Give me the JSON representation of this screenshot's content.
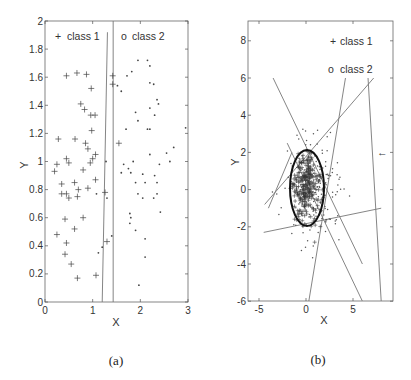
{
  "chart_data": [
    {
      "panel": "(a)",
      "type": "scatter",
      "xlabel": "X",
      "ylabel": "Y",
      "xlim": [
        0,
        3
      ],
      "ylim": [
        0,
        2
      ],
      "xticks": [
        "0",
        "1",
        "2",
        "3"
      ],
      "yticks": [
        "0",
        "0.2",
        "0.4",
        "0.6",
        "0.8",
        "1",
        "1.2",
        "1.4",
        "1.6",
        "1.8",
        "2"
      ],
      "legend": [
        {
          "marker": "+",
          "label": "class 1"
        },
        {
          "marker": "o",
          "label": "class 2"
        }
      ],
      "series": [
        {
          "name": "class 1",
          "marker": "+",
          "points": [
            [
              0.45,
              1.61
            ],
            [
              0.67,
              1.63
            ],
            [
              0.87,
              1.62
            ],
            [
              0.97,
              1.52
            ],
            [
              0.75,
              1.41
            ],
            [
              0.83,
              1.37
            ],
            [
              0.96,
              1.33
            ],
            [
              1.05,
              1.33
            ],
            [
              0.98,
              1.22
            ],
            [
              0.28,
              1.16
            ],
            [
              0.63,
              1.16
            ],
            [
              0.85,
              1.13
            ],
            [
              0.9,
              1.09
            ],
            [
              1.06,
              1.05
            ],
            [
              1.0,
              1.02
            ],
            [
              0.45,
              1.02
            ],
            [
              0.5,
              0.99
            ],
            [
              0.95,
              0.99
            ],
            [
              0.25,
              0.98
            ],
            [
              0.2,
              0.93
            ],
            [
              0.8,
              0.94
            ],
            [
              0.62,
              0.85
            ],
            [
              1.06,
              0.87
            ],
            [
              0.35,
              0.84
            ],
            [
              0.7,
              0.8
            ],
            [
              0.9,
              0.81
            ],
            [
              0.35,
              0.77
            ],
            [
              0.45,
              0.77
            ],
            [
              0.5,
              0.74
            ],
            [
              0.68,
              0.75
            ],
            [
              0.42,
              0.59
            ],
            [
              0.8,
              0.6
            ],
            [
              0.62,
              0.52
            ],
            [
              0.25,
              0.48
            ],
            [
              0.45,
              0.42
            ],
            [
              0.42,
              0.34
            ],
            [
              0.55,
              0.27
            ],
            [
              0.68,
              0.17
            ],
            [
              1.07,
              0.19
            ],
            [
              1.3,
              0.43
            ],
            [
              1.26,
              0.78
            ],
            [
              1.42,
              1.61
            ],
            [
              1.42,
              1.55
            ],
            [
              1.55,
              1.13
            ]
          ]
        },
        {
          "name": "class 2",
          "marker": ".",
          "points": [
            [
              1.95,
              1.72
            ],
            [
              2.15,
              1.72
            ],
            [
              2.2,
              1.68
            ],
            [
              1.72,
              1.61
            ],
            [
              1.82,
              1.64
            ],
            [
              1.6,
              1.5
            ],
            [
              1.52,
              1.54
            ],
            [
              2.2,
              1.56
            ],
            [
              2.28,
              1.55
            ],
            [
              1.9,
              1.35
            ],
            [
              2.2,
              1.38
            ],
            [
              2.35,
              1.44
            ],
            [
              2.38,
              1.41
            ],
            [
              2.3,
              1.33
            ],
            [
              1.95,
              1.29
            ],
            [
              1.7,
              1.23
            ],
            [
              2.15,
              1.23
            ],
            [
              2.2,
              1.23
            ],
            [
              2.95,
              1.24
            ],
            [
              1.85,
              1.0
            ],
            [
              1.6,
              0.92
            ],
            [
              1.75,
              0.95
            ],
            [
              1.8,
              0.92
            ],
            [
              2.2,
              1.05
            ],
            [
              2.4,
              0.98
            ],
            [
              2.55,
              1.06
            ],
            [
              2.62,
              1.0
            ],
            [
              2.7,
              1.1
            ],
            [
              1.65,
              0.98
            ],
            [
              1.9,
              0.85
            ],
            [
              2.05,
              0.91
            ],
            [
              2.3,
              0.9
            ],
            [
              2.35,
              0.85
            ],
            [
              2.1,
              0.85
            ],
            [
              1.95,
              0.77
            ],
            [
              2.05,
              0.74
            ],
            [
              2.28,
              0.74
            ],
            [
              2.35,
              0.77
            ],
            [
              2.42,
              0.64
            ],
            [
              1.78,
              0.63
            ],
            [
              1.8,
              0.6
            ],
            [
              1.9,
              0.51
            ],
            [
              1.78,
              0.56
            ],
            [
              2.1,
              0.45
            ],
            [
              2.1,
              0.32
            ],
            [
              1.97,
              0.12
            ],
            [
              1.08,
              0.77
            ],
            [
              1.2,
              0.39
            ],
            [
              1.12,
              0.35
            ],
            [
              1.3,
              0.74
            ],
            [
              1.4,
              0.47
            ],
            [
              1.28,
              1.0
            ]
          ]
        }
      ],
      "boundaries": [
        {
          "name": "vertical boundary",
          "points": [
            [
              1.43,
              0
            ],
            [
              1.43,
              2
            ]
          ]
        },
        {
          "name": "slanted boundary",
          "points": [
            [
              1.2,
              0
            ],
            [
              1.31,
              1.92
            ]
          ]
        }
      ]
    },
    {
      "panel": "(b)",
      "type": "scatter",
      "xlabel": "X",
      "ylabel": "Y",
      "xlim": [
        -6.2,
        9.2
      ],
      "ylim": [
        -6,
        9
      ],
      "xticks": [
        "-5",
        "0",
        "5"
      ],
      "yticks": [
        "-6",
        "-4",
        "-2",
        "0",
        "2",
        "4",
        "6",
        "8"
      ],
      "legend": [
        {
          "marker": "+",
          "label": "class 1"
        },
        {
          "marker": "o",
          "label": "class 2"
        }
      ],
      "annotations": [
        {
          "type": "ellipse-boundary",
          "center": [
            0.0,
            0.1
          ],
          "rx": 1.8,
          "ry": 2.1
        },
        {
          "type": "arrow-marker",
          "glyph": "←",
          "at": [
            8.1,
            2.0
          ]
        }
      ],
      "boundaries": [
        {
          "points": [
            [
              -3.5,
              6
            ],
            [
              6,
              -4
            ]
          ]
        },
        {
          "points": [
            [
              -4.4,
              -0.8
            ],
            [
              7.2,
              6
            ]
          ]
        },
        {
          "points": [
            [
              4.2,
              6
            ],
            [
              0.3,
              -6
            ]
          ]
        },
        {
          "points": [
            [
              6.6,
              6
            ],
            [
              8.0,
              -6
            ]
          ]
        },
        {
          "points": [
            [
              -4.5,
              -2.3
            ],
            [
              8.0,
              -1.0
            ]
          ]
        },
        {
          "points": [
            [
              -2.0,
              2.5
            ],
            [
              6,
              -6
            ]
          ]
        },
        {
          "points": [
            [
              -4.0,
              -1.0
            ],
            [
              -1.5,
              2.0
            ]
          ]
        }
      ],
      "series": [
        {
          "name": "class 1",
          "marker": "+",
          "note": "dense cluster centered near (0,0)"
        },
        {
          "name": "class 2",
          "marker": ".",
          "note": "diffuse cloud spread around the class 1 cluster"
        }
      ]
    }
  ],
  "captions": {
    "a": "(a)",
    "b": "(b)"
  },
  "axes": {
    "a": {
      "xlabel": "X",
      "ylabel": "Y",
      "xticks": [
        "0",
        "1",
        "2",
        "3"
      ],
      "yticks": [
        "0",
        "0.2",
        "0.4",
        "0.6",
        "0.8",
        "1",
        "1.2",
        "1.4",
        "1.6",
        "1.8",
        "2"
      ],
      "legend1": "class 1",
      "legend2": "class 2",
      "mark1": "+",
      "mark2": "o"
    },
    "b": {
      "xlabel": "X",
      "ylabel": "Y",
      "xticks": [
        "-5",
        "0",
        "5"
      ],
      "yticks": [
        "8",
        "6",
        "4",
        "2",
        "0",
        "-2",
        "-4",
        "-6"
      ],
      "legend1": "class 1",
      "legend2": "class 2",
      "mark1": "+",
      "mark2": "o",
      "arrow": "←"
    }
  },
  "colors": {
    "axis": "#555555",
    "points": "#444444",
    "boundary": "#777777",
    "ellipse": "#111111"
  }
}
